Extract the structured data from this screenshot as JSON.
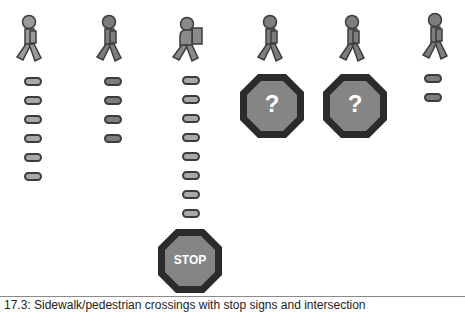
{
  "figure": {
    "columns": [
      {
        "id": "col-1",
        "figure": "walking-person",
        "dash_count": 6,
        "end_sign": null
      },
      {
        "id": "col-2",
        "figure": "walking-person",
        "dash_count": 4,
        "end_sign": null
      },
      {
        "id": "col-3",
        "figure": "walking-person-with-backpack",
        "dash_count": 8,
        "end_sign": "stop"
      },
      {
        "id": "col-4",
        "figure": "walking-person",
        "dash_count": 0,
        "end_sign": "question"
      },
      {
        "id": "col-5",
        "figure": "walking-person",
        "dash_count": 0,
        "end_sign": "question"
      },
      {
        "id": "col-6",
        "figure": "walking-person",
        "dash_count": 2,
        "end_sign": null
      }
    ],
    "signs": {
      "stop_label": "STOP",
      "question_label": "?"
    },
    "colors": {
      "figure_fill": "#8a8a8a",
      "outline": "#3c3c3c",
      "octagon_border": "#2b2b2b",
      "octagon_fill": "#858585",
      "sign_text": "#ffffff"
    }
  },
  "caption": {
    "text": "17.3: Sidewalk/pedestrian crossings with stop signs and intersection"
  }
}
